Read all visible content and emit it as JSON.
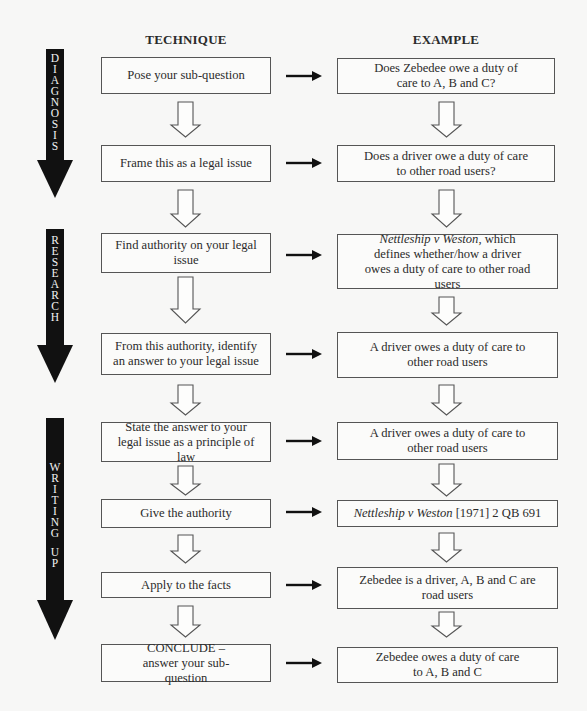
{
  "headers": {
    "technique": "TECHNIQUE",
    "example": "EXAMPLE"
  },
  "phases": [
    {
      "label": "DIAGNOSIS",
      "letters": [
        "D",
        "I",
        "A",
        "G",
        "N",
        "O",
        "S",
        "I",
        "S"
      ]
    },
    {
      "label": "RESEARCH",
      "letters": [
        "R",
        "E",
        "S",
        "E",
        "A",
        "R",
        "C",
        "H"
      ]
    },
    {
      "label": "WRITING UP",
      "letters": [
        "W",
        "R",
        "I",
        "T",
        "I",
        "N",
        "G",
        " ",
        "U",
        "P"
      ]
    }
  ],
  "steps": [
    {
      "technique": "Pose your sub-question",
      "example": "Does Zebedee owe a duty of care to A, B and C?"
    },
    {
      "technique": "Frame this as a legal issue",
      "example": "Does a driver owe a duty of care to other road users?"
    },
    {
      "technique": "Find authority on your legal issue",
      "example_italic": "Nettleship v Weston",
      "example": ", which defines whether/how a driver owes a duty of care to other road users"
    },
    {
      "technique": "From this authority, identify an answer to your legal issue",
      "example": "A driver owes a duty of care to other road users"
    },
    {
      "technique": "State the answer to your legal issue as a principle of law",
      "example": "A driver owes a duty of care to other road users"
    },
    {
      "technique": "Give the authority",
      "example_italic": "Nettleship v Weston",
      "example": " [1971] 2 QB 691"
    },
    {
      "technique": "Apply to the facts",
      "example": "Zebedee is a driver, A, B and C are road users"
    },
    {
      "technique": "CONCLUDE – answer your sub-question",
      "example": "Zebedee owes a duty of care to A, B and C"
    }
  ],
  "colors": {
    "phase_arrow": "#111111",
    "box_border": "#555555",
    "background": "#f7f7f6"
  }
}
